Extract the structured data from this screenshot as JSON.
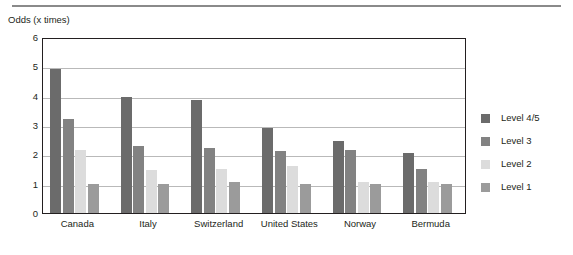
{
  "chart_data": {
    "type": "bar",
    "title": "",
    "subtitle": "",
    "xlabel": "",
    "ylabel": "Odds (x times)",
    "ylim": [
      0,
      6
    ],
    "ytick_labels": [
      "6",
      "5",
      "4",
      "3",
      "2",
      "1",
      "0"
    ],
    "ytick_values": [
      6,
      5,
      4,
      3,
      2,
      1,
      0
    ],
    "grid": true,
    "legend_position": "right",
    "categories": [
      "Canada",
      "Italy",
      "Switzerland",
      "United States",
      "Norway",
      "Bermuda"
    ],
    "series": [
      {
        "name": "Level 4/5",
        "color": "#6b6b6b",
        "values": [
          4.9,
          3.95,
          3.85,
          2.9,
          2.45,
          2.05
        ]
      },
      {
        "name": "Level 3",
        "color": "#828282",
        "values": [
          3.2,
          2.3,
          2.2,
          2.1,
          2.15,
          1.5
        ]
      },
      {
        "name": "Level 2",
        "color": "#dcdcdc",
        "values": [
          2.15,
          1.45,
          1.5,
          1.6,
          1.05,
          1.05
        ]
      },
      {
        "name": "Level 1",
        "color": "#9b9b9b",
        "values": [
          1.0,
          1.0,
          1.05,
          1.0,
          1.0,
          1.0
        ]
      }
    ]
  },
  "legend": {
    "items": [
      {
        "label": "Level 4/5",
        "color": "#6b6b6b"
      },
      {
        "label": "Level 3",
        "color": "#828282"
      },
      {
        "label": "Level 2",
        "color": "#dcdcdc"
      },
      {
        "label": "Level 1",
        "color": "#9b9b9b"
      }
    ]
  },
  "axis": {
    "y_title": "Odds (x times)"
  }
}
